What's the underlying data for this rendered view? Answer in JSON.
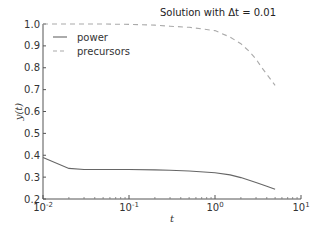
{
  "chart_data": {
    "type": "line",
    "title": "Solution with Δt = 0.01",
    "xlabel": "t",
    "ylabel": "y(t)",
    "xscale": "log",
    "xlim": [
      0.01,
      10
    ],
    "ylim": [
      0.2,
      1.0
    ],
    "xticks": [
      0.01,
      0.1,
      1,
      10
    ],
    "xtick_labels": [
      {
        "base": "10",
        "exp": "-2"
      },
      {
        "base": "10",
        "exp": "-1"
      },
      {
        "base": "10",
        "exp": "0"
      },
      {
        "base": "10",
        "exp": "1"
      }
    ],
    "yticks": [
      0.2,
      0.3,
      0.4,
      0.5,
      0.6,
      0.7,
      0.8,
      0.9,
      1.0
    ],
    "ytick_labels": [
      "0.2",
      "0.3",
      "0.4",
      "0.5",
      "0.6",
      "0.7",
      "0.8",
      "0.9",
      "1.0"
    ],
    "grid": false,
    "legend_position": "upper left",
    "series": [
      {
        "name": "power",
        "style": "solid",
        "color": "#666666",
        "x": [
          0.01,
          0.02,
          0.03,
          0.05,
          0.1,
          0.2,
          0.3,
          0.5,
          1.0,
          1.5,
          2.0,
          3.0,
          4.0,
          5.0
        ],
        "y": [
          0.39,
          0.34,
          0.335,
          0.335,
          0.335,
          0.333,
          0.331,
          0.328,
          0.32,
          0.31,
          0.298,
          0.275,
          0.258,
          0.245
        ]
      },
      {
        "name": "precursors",
        "style": "dashed",
        "color": "#aaaaaa",
        "x": [
          0.01,
          0.02,
          0.05,
          0.1,
          0.2,
          0.3,
          0.5,
          1.0,
          1.5,
          2.0,
          2.5,
          3.0,
          3.5,
          4.0,
          5.0
        ],
        "y": [
          1.0,
          1.0,
          1.0,
          0.998,
          0.995,
          0.99,
          0.985,
          0.97,
          0.94,
          0.91,
          0.875,
          0.84,
          0.8,
          0.77,
          0.72
        ]
      }
    ]
  }
}
